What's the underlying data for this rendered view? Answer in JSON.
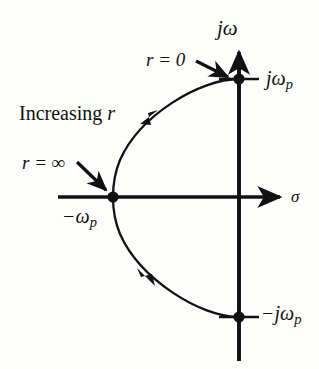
{
  "figure": {
    "type": "root-locus-diagram",
    "background_color": "#fdfdfb",
    "ink_color": "#111111"
  },
  "axes": {
    "vertical": {
      "label": "jω",
      "name": "imaginary-axis",
      "origin_px": [
        239,
        197
      ],
      "top_px": [
        239,
        47
      ],
      "bottom_px": [
        239,
        361
      ],
      "arrow_at": "top"
    },
    "horizontal": {
      "label": "σ",
      "name": "real-axis",
      "left_px": [
        58,
        197
      ],
      "right_px": [
        287,
        197
      ],
      "arrow_at": "right"
    }
  },
  "points": [
    {
      "name": "pole-upper",
      "label": "jω",
      "label_sub": "p",
      "x_px": 239,
      "y_px": 79
    },
    {
      "name": "pole-breakin",
      "label": "−ω",
      "label_sub": "p",
      "x_px": 113,
      "y_px": 197
    },
    {
      "name": "pole-lower",
      "label": "−jω",
      "label_sub": "p",
      "x_px": 239,
      "y_px": 317
    }
  ],
  "annotations": {
    "r_zero": {
      "text": "r = 0",
      "arrow_from_px": [
        196,
        61
      ],
      "arrow_to_px": [
        230,
        78
      ]
    },
    "r_infinity": {
      "text": "r = ∞",
      "arrow_from_px": [
        77,
        162
      ],
      "arrow_to_px": [
        108,
        192
      ]
    },
    "increasing_r": {
      "text": "Increasing r"
    }
  },
  "locus": {
    "description": "semicircular root locus arc in left half plane",
    "upper_arc_from_px": [
      239,
      79
    ],
    "upper_arc_to_px": [
      113,
      197
    ],
    "lower_arc_from_px": [
      113,
      197
    ],
    "lower_arc_to_px": [
      239,
      317
    ],
    "direction_arrow_upper_px": [
      147,
      118
    ],
    "direction_arrow_lower_px": [
      146,
      280
    ]
  },
  "chart_data": {
    "type": "scatter",
    "title": "",
    "xlabel": "σ",
    "ylabel": "jω",
    "annotations": [
      "r = 0",
      "r = ∞",
      "Increasing r"
    ],
    "tick_labels": [
      "jω_p",
      "-ω_p",
      "-jω_p"
    ],
    "points": [
      {
        "label": "jω_p",
        "x": 0,
        "y": 1
      },
      {
        "label": "-ω_p",
        "x": -1,
        "y": 0
      },
      {
        "label": "-jω_p",
        "x": 0,
        "y": -1
      }
    ],
    "curve": "unit semicircle in left half plane from (0,1) through (-1,0) to (0,-1)",
    "grid": false,
    "legend": "none"
  }
}
